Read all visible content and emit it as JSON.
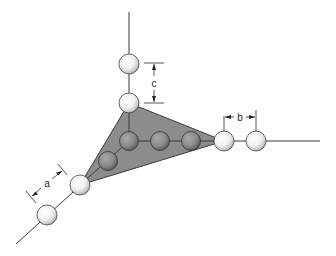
{
  "diagram": {
    "title": "",
    "colors": {
      "plane_fill": "#8c8c8c",
      "plane_stroke": "#3a3a3a",
      "sphere_light": "#f4f4f4",
      "sphere_dark": "#8a8a8a",
      "line": "#3a3a3a"
    },
    "labels": {
      "a": "a",
      "b": "b",
      "c": "c"
    },
    "axes": [
      {
        "name": "vertical-axis",
        "from": [
          128,
          12
        ],
        "to": [
          128,
          103
        ]
      },
      {
        "name": "horizontal-axis",
        "from": [
          224,
          141
        ],
        "to": [
          320,
          141
        ]
      },
      {
        "name": "diagonal-axis",
        "from": [
          80,
          184
        ],
        "to": [
          16,
          244
        ]
      }
    ],
    "plane": {
      "vertices": [
        [
          128,
          103
        ],
        [
          224,
          141
        ],
        [
          80,
          184
        ]
      ]
    },
    "spheres_outside": [
      {
        "x": 129,
        "y": 64,
        "r": 10
      },
      {
        "x": 129,
        "y": 103,
        "r": 10
      },
      {
        "x": 224,
        "y": 141,
        "r": 10
      },
      {
        "x": 256,
        "y": 141,
        "r": 10
      },
      {
        "x": 80,
        "y": 185,
        "r": 10
      },
      {
        "x": 47,
        "y": 215,
        "r": 10
      }
    ],
    "spheres_inside": [
      {
        "x": 129,
        "y": 141,
        "r": 9
      },
      {
        "x": 160,
        "y": 141,
        "r": 9
      },
      {
        "x": 191,
        "y": 141,
        "r": 9
      },
      {
        "x": 108,
        "y": 161,
        "r": 9
      }
    ],
    "dimensions": {
      "c": {
        "x": 153,
        "y_top": 63,
        "y_bottom": 103
      },
      "b": {
        "y": 124,
        "x_left": 224,
        "x_right": 256
      },
      "a": {
        "from": [
          30,
          195
        ],
        "to": [
          62,
          168
        ]
      }
    }
  }
}
